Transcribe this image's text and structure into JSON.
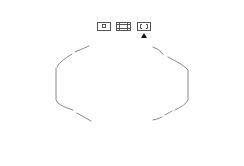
{
  "toolbar": {
    "buttons": [
      {
        "id": "single-frame",
        "icon": "small-square-in-frame-icon",
        "selected": false
      },
      {
        "id": "grid-frame",
        "icon": "grid-frame-icon",
        "selected": false
      },
      {
        "id": "corner-brackets",
        "icon": "corner-brackets-icon",
        "selected": true
      }
    ],
    "selected_indicator": "up-triangle-icon"
  },
  "viewport": {
    "shape": "dashed-octagon-outline",
    "stroke_color": "#8a8a8a"
  },
  "colors": {
    "background": "#ffffff",
    "button_border": "#555555",
    "indicator": "#111111"
  }
}
